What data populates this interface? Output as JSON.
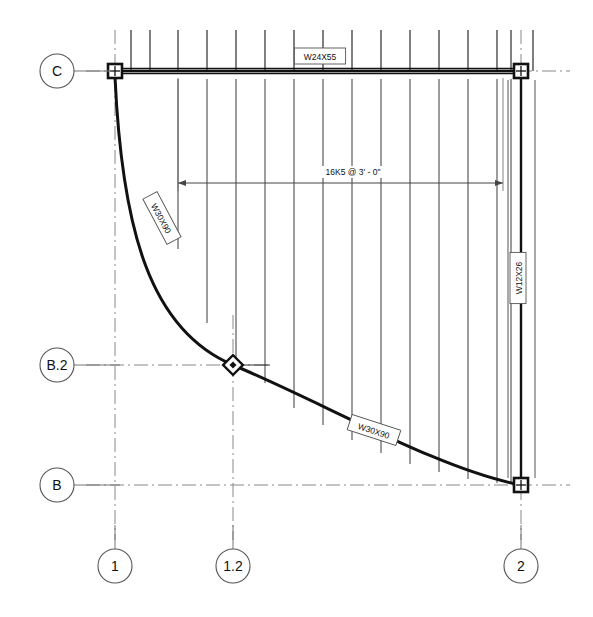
{
  "drawing": {
    "type": "structural-framing-plan",
    "title": "",
    "line_color": "#1a1a1a",
    "grid_color": "#808080",
    "background": "#ffffff"
  },
  "grid_bubbles": {
    "horizontal": [
      {
        "label": "C",
        "cx": 57,
        "cy": 71,
        "r": 17,
        "leader_x2": 112
      },
      {
        "label": "B.2",
        "cx": 57,
        "cy": 365,
        "r": 17,
        "leader_x2": 120
      },
      {
        "label": "B",
        "cx": 57,
        "cy": 485,
        "r": 17,
        "leader_x2": 120
      }
    ],
    "vertical": [
      {
        "label": "1",
        "cx": 115,
        "cy": 566,
        "r": 17,
        "leader_y2": 525
      },
      {
        "label": "1.2",
        "cx": 233,
        "cy": 566,
        "r": 17,
        "leader_y2": 525
      },
      {
        "label": "2",
        "cx": 521,
        "cy": 566,
        "r": 17,
        "leader_y2": 525
      }
    ]
  },
  "gridlines": {
    "horizontal": [
      {
        "name": "C",
        "y": 71,
        "x1": 86,
        "x2": 570
      },
      {
        "name": "B.2",
        "y": 365,
        "x1": 86,
        "x2": 270
      },
      {
        "name": "B",
        "y": 485,
        "x1": 86,
        "x2": 570
      }
    ],
    "vertical": [
      {
        "name": "1",
        "x": 115,
        "y1": 30,
        "y2": 540
      },
      {
        "name": "1.2",
        "x": 233,
        "y1": 315,
        "y2": 540
      },
      {
        "name": "2",
        "x": 521,
        "y1": 30,
        "y2": 540
      }
    ]
  },
  "columns": [
    {
      "id": "col-c-1",
      "grid": "C/1",
      "shape": "square",
      "x": 115,
      "y": 71
    },
    {
      "id": "col-c-2",
      "grid": "C/2",
      "shape": "square",
      "x": 521,
      "y": 71
    },
    {
      "id": "col-b-2",
      "grid": "B/2",
      "shape": "square",
      "x": 521,
      "y": 485
    },
    {
      "id": "col-b2-12",
      "grid": "B.2/1.2",
      "shape": "diamond",
      "x": 233,
      "y": 365
    }
  ],
  "beams": [
    {
      "id": "beam-top",
      "label": "W24X55",
      "orientation": "horizontal",
      "label_x": 320,
      "label_y": 56,
      "rotation": 0
    },
    {
      "id": "beam-right",
      "label": "W12X26",
      "orientation": "vertical",
      "label_x": 518,
      "label_y": 278,
      "rotation": -90
    },
    {
      "id": "beam-curve-upper",
      "label": "W30X90",
      "orientation": "curved",
      "label_x": 162,
      "label_y": 218,
      "rotation": 62
    },
    {
      "id": "beam-curve-lower",
      "label": "W30X90",
      "orientation": "curved",
      "label_x": 374,
      "label_y": 430,
      "rotation": 18
    }
  ],
  "dimension": {
    "text": "16K5 @ 3' - 0\"",
    "text_x": 353,
    "text_y": 175,
    "line_y": 183,
    "x1": 178,
    "x2": 503
  },
  "joists": {
    "designation": "16K5",
    "spacing": "3' - 0\"",
    "count": 13,
    "top_y": 30,
    "note": "vertical bar joists spanning from grid C beam down to the curved W30X90 beam"
  },
  "joist_lines": [
    {
      "x": 131,
      "y_top": 30,
      "y_bot": 71
    },
    {
      "x": 150,
      "y_top": 30,
      "y_bot": 71
    },
    {
      "x": 178,
      "y_top": 30,
      "y_bot": 71
    },
    {
      "x": 207,
      "y_top": 30,
      "y_bot": 71
    },
    {
      "x": 236,
      "y_top": 30,
      "y_bot": 71
    },
    {
      "x": 265,
      "y_top": 30,
      "y_bot": 71
    },
    {
      "x": 294,
      "y_top": 30,
      "y_bot": 71
    },
    {
      "x": 323,
      "y_top": 30,
      "y_bot": 71
    },
    {
      "x": 352,
      "y_top": 30,
      "y_bot": 71
    },
    {
      "x": 381,
      "y_top": 30,
      "y_bot": 71
    },
    {
      "x": 410,
      "y_top": 30,
      "y_bot": 71
    },
    {
      "x": 439,
      "y_top": 30,
      "y_bot": 71
    },
    {
      "x": 468,
      "y_top": 30,
      "y_bot": 71
    },
    {
      "x": 497,
      "y_top": 30,
      "y_bot": 71
    },
    {
      "x": 511,
      "y_top": 30,
      "y_bot": 71
    },
    {
      "x": 533,
      "y_top": 30,
      "y_bot": 71
    }
  ],
  "joist_spans": [
    {
      "x": 178,
      "y_top": 79,
      "y_bot": 249
    },
    {
      "x": 207,
      "y_top": 79,
      "y_bot": 323
    },
    {
      "x": 236,
      "y_top": 79,
      "y_bot": 369
    },
    {
      "x": 265,
      "y_top": 79,
      "y_bot": 383
    },
    {
      "x": 294,
      "y_top": 79,
      "y_bot": 408
    },
    {
      "x": 323,
      "y_top": 79,
      "y_bot": 425
    },
    {
      "x": 352,
      "y_top": 79,
      "y_bot": 440
    },
    {
      "x": 381,
      "y_top": 79,
      "y_bot": 453
    },
    {
      "x": 410,
      "y_top": 79,
      "y_bot": 464
    },
    {
      "x": 439,
      "y_top": 79,
      "y_bot": 472
    },
    {
      "x": 468,
      "y_top": 79,
      "y_bot": 479
    },
    {
      "x": 497,
      "y_top": 79,
      "y_bot": 483
    },
    {
      "x": 511,
      "y_top": 79,
      "y_bot": 484
    }
  ]
}
